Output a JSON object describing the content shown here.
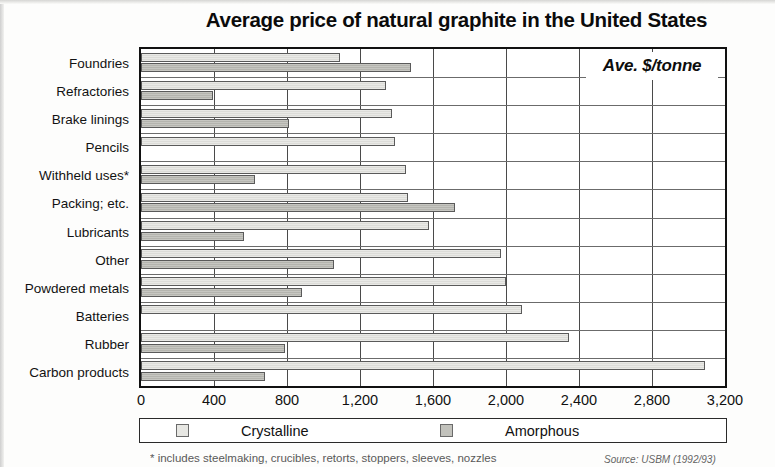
{
  "chart_data": {
    "type": "bar",
    "orientation": "horizontal",
    "title": "Average price of natural graphite in the United States",
    "annotation": "Ave. $/tonne",
    "xlabel": "",
    "ylabel": "",
    "xlim": [
      0,
      3200
    ],
    "xticks": [
      0,
      400,
      800,
      1200,
      1600,
      2000,
      2400,
      2800,
      3200
    ],
    "xtick_labels": [
      "0",
      "400",
      "800",
      "1,200",
      "1,600",
      "2,000",
      "2,400",
      "2,800",
      "3,200"
    ],
    "grid": true,
    "legend_position": "bottom",
    "categories": [
      "Foundries",
      "Refractories",
      "Brake linings",
      "Pencils",
      "Withheld uses*",
      "Packing; etc.",
      "Lubricants",
      "Other",
      "Powdered metals",
      "Batteries",
      "Rubber",
      "Carbon products"
    ],
    "series": [
      {
        "name": "Crystalline",
        "color": "#e7e7e3",
        "values": [
          1090,
          1340,
          1375,
          1390,
          1450,
          1465,
          1580,
          1970,
          2000,
          2090,
          2345,
          3090
        ]
      },
      {
        "name": "Amorphous",
        "color": "#c2c2bc",
        "values": [
          1480,
          395,
          810,
          null,
          625,
          1720,
          565,
          1060,
          880,
          null,
          790,
          680
        ]
      }
    ],
    "footnote": "* includes steelmaking, crucibles, retorts, stoppers, sleeves, nozzles",
    "source": "Source: USBM (1992/93)"
  }
}
